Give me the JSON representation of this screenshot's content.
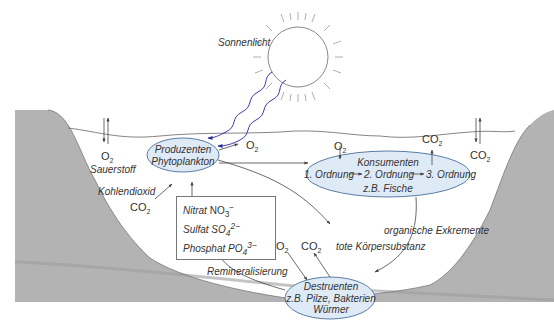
{
  "colors": {
    "ground": "#b3b3b3",
    "ellipse_fill": "#dfeaf7",
    "ellipse_stroke": "#4a6f9a",
    "light_waves": "#3a3aa8",
    "line": "#555555",
    "text": "#333333"
  },
  "sun": {
    "label": "Sonnenlicht"
  },
  "gas_exchange": {
    "left": {
      "formula": "O",
      "sub": "2",
      "label": "Sauerstoff"
    },
    "right": {
      "formula": "CO",
      "sub": "2"
    }
  },
  "producers": {
    "title": "Produzenten",
    "subtitle": "Phytoplankton",
    "output": {
      "formula": "O",
      "sub": "2"
    }
  },
  "co2_input": {
    "label": "Kohlendioxid",
    "formula": "CO",
    "sub": "2"
  },
  "nutrients": [
    {
      "name": "Nitrat",
      "formula": "NO",
      "sub": "3",
      "sup": "−"
    },
    {
      "name": "Sulfat",
      "formula": "SO",
      "sub": "4",
      "sup": "2−"
    },
    {
      "name": "Phosphat",
      "formula": "PO",
      "sub": "4",
      "sup": "3−"
    }
  ],
  "consumers": {
    "title": "Konsumenten",
    "chain": [
      "1. Ordnung",
      "2. Ordnung",
      "3. Ordnung"
    ],
    "example": "z.B. Fische",
    "input": {
      "formula": "O",
      "sub": "2"
    },
    "output": {
      "formula": "CO",
      "sub": "2"
    }
  },
  "flows": {
    "organic_excrements": "organische Exkremente",
    "dead_matter": "tote Körpersubstanz",
    "remineralization": "Remineralisierung"
  },
  "decomposers": {
    "title": "Destruenten",
    "line2": "z.B. Pilze, Bakterien",
    "line3": "Würmer",
    "input": {
      "formula": "O",
      "sub": "2"
    },
    "output": {
      "formula": "CO",
      "sub": "2"
    }
  }
}
